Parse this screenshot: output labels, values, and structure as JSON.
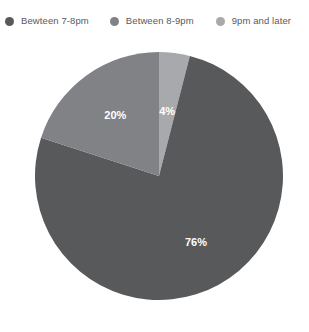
{
  "legend": {
    "items": [
      {
        "label": "Bewteen 7-8pm",
        "color": "#58595b",
        "dot_name": "legend-dot-between-7-8pm"
      },
      {
        "label": "Between 8-9pm",
        "color": "#808285",
        "dot_name": "legend-dot-between-8-9pm"
      },
      {
        "label": "9pm and later",
        "color": "#a7a9ac",
        "dot_name": "legend-dot-9pm-and-later"
      }
    ]
  },
  "chart_data": {
    "type": "pie",
    "title": "",
    "categories": [
      "Bewteen 7-8pm",
      "Between 8-9pm",
      "9pm and later"
    ],
    "values": [
      76,
      20,
      4
    ],
    "value_labels": [
      "76%",
      "20%",
      "4%"
    ],
    "colors": [
      "#58595b",
      "#808285",
      "#a7a9ac"
    ],
    "units": "percent",
    "legend_position": "top",
    "grid": false,
    "start_angle_deg": 0,
    "direction": "clockwise",
    "slice_order": [
      "9pm and later",
      "Bewteen 7-8pm",
      "Between 8-9pm"
    ]
  }
}
